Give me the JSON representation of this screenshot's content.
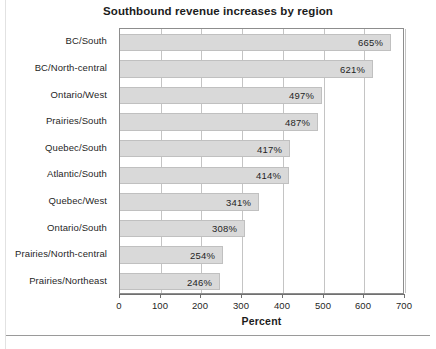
{
  "chart_data": {
    "type": "bar",
    "orientation": "horizontal",
    "title": "Southbound revenue increases by region",
    "xlabel": "Percent",
    "ylabel": "",
    "xlim": [
      0,
      700
    ],
    "xticks": [
      0,
      100,
      200,
      300,
      400,
      500,
      600,
      700
    ],
    "xtick_labels": [
      "0",
      "100",
      "200",
      "300",
      "400",
      "500",
      "600",
      "700"
    ],
    "grid": true,
    "legend": false,
    "bar_color": "#d9d9d9",
    "bar_border_color": "#c0c0c0",
    "categories": [
      "BC/South",
      "BC/North-central",
      "Ontario/West",
      "Prairies/South",
      "Quebec/South",
      "Atlantic/South",
      "Quebec/West",
      "Ontario/South",
      "Prairies/North-central",
      "Prairies/Northeast"
    ],
    "values": [
      665,
      621,
      497,
      487,
      417,
      414,
      341,
      308,
      254,
      246
    ],
    "data_labels": [
      "665%",
      "621%",
      "497%",
      "487%",
      "417%",
      "414%",
      "341%",
      "308%",
      "254%",
      "246%"
    ]
  }
}
